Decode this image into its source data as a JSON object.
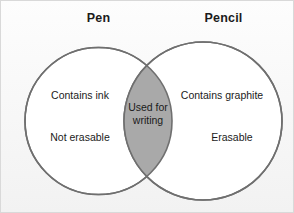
{
  "figure": {
    "type": "venn-diagram",
    "sets": 2,
    "background_color": "#fafafa",
    "border_color": "#d9d9d9",
    "circle_stroke_color": "#6f6f6f",
    "circle_fill_color": "#ffffff",
    "overlap_fill_color": "#a9a9a9",
    "text_color": "#1b1b1b"
  },
  "left_set": {
    "title": "Pen",
    "items": [
      "Contains ink",
      "Not erasable"
    ]
  },
  "right_set": {
    "title": "Pencil",
    "items": [
      "Contains graphite",
      "Erasable"
    ]
  },
  "overlap": {
    "line_1": "Used for",
    "line_2": "writing",
    "full_text": "Used for writing"
  }
}
